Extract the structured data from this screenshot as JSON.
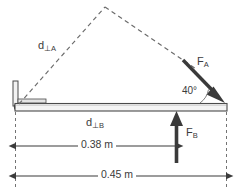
{
  "diagram": {
    "colors": {
      "line": "#3b3b3b",
      "beam_fill": "#f2f2f2",
      "beam_stroke": "#4a4a4a",
      "dashed": "#6b6b6b",
      "arrow": "#3a3a3a",
      "background": "#ffffff"
    },
    "labels": {
      "d_perp_a": {
        "base": "d",
        "sub": "⊥A"
      },
      "d_perp_b": {
        "base": "d",
        "sub": "⊥B"
      },
      "force_a": {
        "base": "F",
        "sub": "A"
      },
      "force_b": {
        "base": "F",
        "sub": "B"
      },
      "angle": "40°",
      "dimension_inner": "0.38 m",
      "dimension_outer": "0.45 m"
    },
    "measurements": [
      {
        "name": "inner-span",
        "value": "0.38 m"
      },
      {
        "name": "outer-span",
        "value": "0.45 m"
      },
      {
        "name": "force-a-angle",
        "value": "40°"
      }
    ]
  }
}
